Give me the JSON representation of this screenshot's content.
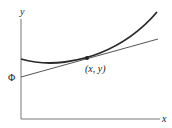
{
  "diagram": {
    "axes": {
      "x_label": "x",
      "y_label": "y"
    },
    "point_label": "(x, y)",
    "intercept_label": "Φ",
    "elements": [
      {
        "type": "curve",
        "description": "convex curve with minimum near left, rising to upper right"
      },
      {
        "type": "tangent_line",
        "description": "straight line tangent to curve at (x, y), intersecting y-axis at Φ"
      },
      {
        "type": "point",
        "description": "point of tangency (x, y)"
      }
    ],
    "colors": {
      "curve": "#2a2a2a",
      "tangent": "#555555",
      "axes": "#777777"
    }
  }
}
